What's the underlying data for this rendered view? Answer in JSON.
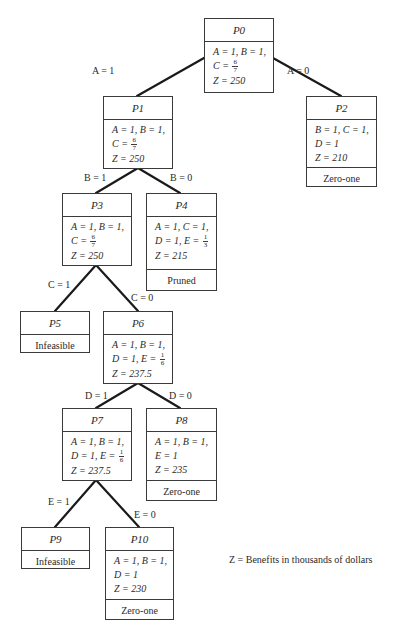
{
  "diagram": {
    "type": "branch-and-bound tree",
    "nodes": [
      {
        "id": "P0",
        "label": "P0",
        "lines": [
          "A = 1, B = 1,",
          "C = 6/7",
          "Z = 250"
        ],
        "status": ""
      },
      {
        "id": "P1",
        "label": "P1",
        "lines": [
          "A = 1, B = 1,",
          "C = 6/7",
          "Z = 250"
        ],
        "status": ""
      },
      {
        "id": "P2",
        "label": "P2",
        "lines": [
          "B = 1, C = 1,",
          "D = 1",
          "Z = 210"
        ],
        "status": "Zero-one"
      },
      {
        "id": "P3",
        "label": "P3",
        "lines": [
          "A = 1, B = 1,",
          "C = 6/7",
          "Z = 250"
        ],
        "status": ""
      },
      {
        "id": "P4",
        "label": "P4",
        "lines": [
          "A = 1, C = 1,",
          "D = 1, E = 1/3",
          "Z = 215"
        ],
        "status": "Pruned"
      },
      {
        "id": "P5",
        "label": "P5",
        "lines": [],
        "status": "Infeasible"
      },
      {
        "id": "P6",
        "label": "P6",
        "lines": [
          "A = 1, B = 1,",
          "D = 1, E = 1/6",
          "Z = 237.5"
        ],
        "status": ""
      },
      {
        "id": "P7",
        "label": "P7",
        "lines": [
          "A = 1, B = 1,",
          "D = 1, E = 1/6",
          "Z = 237.5"
        ],
        "status": ""
      },
      {
        "id": "P8",
        "label": "P8",
        "lines": [
          "A = 1, B = 1,",
          "E = 1",
          "Z = 235"
        ],
        "status": "Zero-one"
      },
      {
        "id": "P9",
        "label": "P9",
        "lines": [],
        "status": "Infeasible"
      },
      {
        "id": "P10",
        "label": "P10",
        "lines": [
          "A = 1, B = 1,",
          "D = 1",
          "Z = 230"
        ],
        "status": "Zero-one"
      }
    ],
    "edges": [
      {
        "from": "P0",
        "to": "P1",
        "label": "A = 1"
      },
      {
        "from": "P0",
        "to": "P2",
        "label": "A = 0"
      },
      {
        "from": "P1",
        "to": "P3",
        "label": "B = 1"
      },
      {
        "from": "P1",
        "to": "P4",
        "label": "B = 0"
      },
      {
        "from": "P3",
        "to": "P5",
        "label": "C = 1"
      },
      {
        "from": "P3",
        "to": "P6",
        "label": "C = 0"
      },
      {
        "from": "P6",
        "to": "P7",
        "label": "D = 1"
      },
      {
        "from": "P6",
        "to": "P8",
        "label": "D = 0"
      },
      {
        "from": "P7",
        "to": "P9",
        "label": "E = 1"
      },
      {
        "from": "P7",
        "to": "P10",
        "label": "E = 0"
      }
    ],
    "legend": "Z = Benefits in thousands of dollars"
  },
  "nodes": {
    "p0": {
      "label": "P0",
      "l1": "A = 1, B = 1,",
      "l2a": "C =",
      "l2n": "6",
      "l2d": "7",
      "l3": "Z = 250"
    },
    "p1": {
      "label": "P1",
      "l1": "A = 1, B = 1,",
      "l2a": "C =",
      "l2n": "6",
      "l2d": "7",
      "l3": "Z = 250"
    },
    "p2": {
      "label": "P2",
      "l1": "B = 1, C = 1,",
      "l2a": "D = 1",
      "l3": "Z = 210",
      "status": "Zero-one"
    },
    "p3": {
      "label": "P3",
      "l1": "A = 1, B = 1,",
      "l2a": "C =",
      "l2n": "6",
      "l2d": "7",
      "l3": "Z = 250"
    },
    "p4": {
      "label": "P4",
      "l1": "A = 1, C = 1,",
      "l2a": "D = 1, E =",
      "l2n": "1",
      "l2d": "3",
      "l3": "Z = 215",
      "status": "Pruned"
    },
    "p5": {
      "label": "P5",
      "status": "Infeasible"
    },
    "p6": {
      "label": "P6",
      "l1": "A = 1, B = 1,",
      "l2a": "D = 1, E =",
      "l2n": "1",
      "l2d": "6",
      "l3": "Z = 237.5"
    },
    "p7": {
      "label": "P7",
      "l1": "A = 1, B = 1,",
      "l2a": "D = 1, E =",
      "l2n": "1",
      "l2d": "6",
      "l3": "Z = 237.5"
    },
    "p8": {
      "label": "P8",
      "l1": "A = 1, B = 1,",
      "l2a": "E = 1",
      "l3": "Z = 235",
      "status": "Zero-one"
    },
    "p9": {
      "label": "P9",
      "status": "Infeasible"
    },
    "p10": {
      "label": "P10",
      "l1": "A = 1, B = 1,",
      "l2a": "D = 1",
      "l3": "Z = 230",
      "status": "Zero-one"
    }
  },
  "edge_labels": {
    "a1": "A = 1",
    "a0": "A = 0",
    "b1": "B = 1",
    "b0": "B = 0",
    "c1": "C = 1",
    "c0": "C = 0",
    "d1": "D = 1",
    "d0": "D = 0",
    "e1": "E = 1",
    "e0": "E = 0"
  },
  "legend": {
    "text": "Z = Benefits in thousands of dollars"
  },
  "colors": {
    "line": "#1a1a1a",
    "border": "#3a3a3a",
    "text": "#2a2a2a",
    "background": "#ffffff"
  }
}
